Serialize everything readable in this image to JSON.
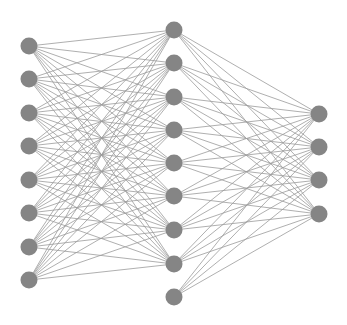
{
  "diagram": {
    "type": "neural-network",
    "colors": {
      "node": "#858585",
      "edge": "#9a9a9a",
      "background": "#ffffff"
    },
    "node_radius": 8.5,
    "layers": [
      {
        "name": "input",
        "x": 29,
        "ys": [
          46,
          79,
          113,
          146,
          180,
          213,
          247,
          280
        ],
        "bias_count": 0
      },
      {
        "name": "hidden",
        "x": 174,
        "ys": [
          30,
          63,
          97,
          130,
          163,
          196,
          230,
          264,
          297
        ],
        "receives_input": [
          true,
          true,
          true,
          true,
          true,
          true,
          true,
          true,
          false
        ]
      },
      {
        "name": "output",
        "x": 319,
        "ys": [
          114,
          147,
          180,
          214
        ]
      }
    ],
    "node_counts": [
      8,
      9,
      4
    ]
  }
}
